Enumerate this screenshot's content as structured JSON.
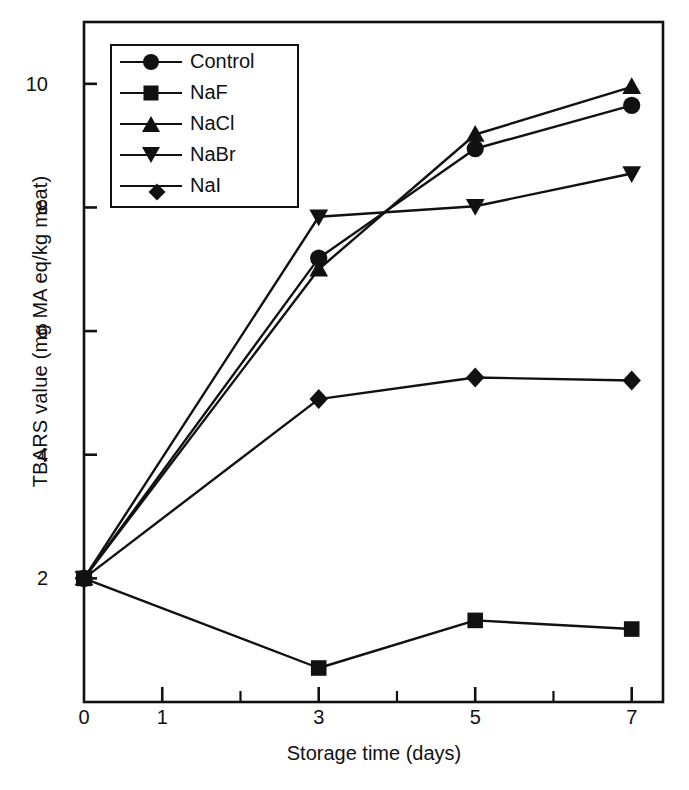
{
  "chart_data": {
    "type": "line",
    "title": "",
    "xlabel": "Storage time (days)",
    "ylabel": "TBARS value (mg MA eq/kg meat)",
    "x": [
      0,
      3,
      5,
      7
    ],
    "xlim": [
      0,
      7.4
    ],
    "ylim": [
      0,
      11.0
    ],
    "xticks_major": [
      0,
      1,
      3,
      5,
      7
    ],
    "xticks_minor": [
      2,
      4,
      6
    ],
    "xtick_labels": [
      "0",
      "1",
      "3",
      "5",
      "7"
    ],
    "yticks": [
      2,
      4,
      6,
      8,
      10
    ],
    "ytick_labels": [
      "2",
      "4",
      "6",
      "8",
      "10"
    ],
    "grid": false,
    "legend_position": "upper-left-inside",
    "series": [
      {
        "name": "Control",
        "marker": "circle",
        "values": [
          2.0,
          7.18,
          8.95,
          9.65
        ]
      },
      {
        "name": "NaF",
        "marker": "square",
        "values": [
          2.0,
          0.55,
          1.32,
          1.18
        ]
      },
      {
        "name": "NaCl",
        "marker": "triangle-up",
        "values": [
          2.0,
          7.0,
          9.18,
          9.95
        ]
      },
      {
        "name": "NaBr",
        "marker": "triangle-down",
        "values": [
          2.0,
          7.85,
          8.02,
          8.55
        ]
      },
      {
        "name": "NaI",
        "marker": "diamond",
        "values": [
          2.0,
          4.9,
          5.25,
          5.2
        ]
      }
    ]
  },
  "axes": {
    "x_title": "Storage time (days)",
    "y_title": "TBARS value (mg MA eq/kg meat)",
    "x_labels": [
      "0",
      "1",
      "3",
      "5",
      "7"
    ],
    "y_labels": [
      "2",
      "4",
      "6",
      "8",
      "10"
    ]
  },
  "legend": {
    "items": [
      {
        "label": "Control",
        "marker": "circle"
      },
      {
        "label": "NaF",
        "marker": "square"
      },
      {
        "label": "NaCl",
        "marker": "triangle-up"
      },
      {
        "label": "NaBr",
        "marker": "triangle-down"
      },
      {
        "label": "NaI",
        "marker": "diamond"
      }
    ]
  },
  "colors": {
    "ink": "#111111",
    "background": "#ffffff"
  }
}
